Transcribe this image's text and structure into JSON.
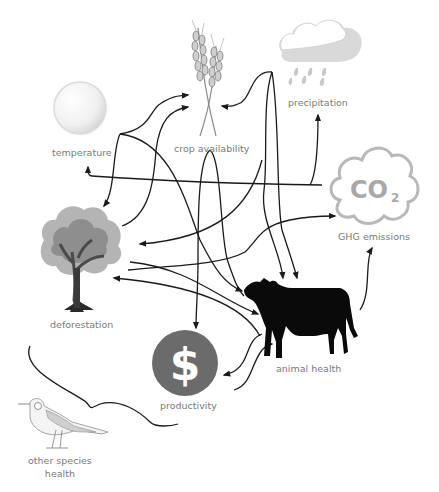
{
  "diagram": {
    "background": "#ffffff",
    "line_color": "#1a1a1a",
    "label_color": "#7a7a7a",
    "nodes": [
      {
        "id": "temperature",
        "label": "temperature",
        "icon": "sun-icon"
      },
      {
        "id": "crop",
        "label": "crop availability",
        "icon": "wheat-icon"
      },
      {
        "id": "precipitation",
        "label": "precipitation",
        "icon": "rain-cloud-icon"
      },
      {
        "id": "ghg",
        "label": "GHG emissions",
        "icon": "co2-cloud-icon",
        "icon_text": "CO",
        "icon_subscript": "2"
      },
      {
        "id": "deforestation",
        "label": "deforestation",
        "icon": "tree-icon"
      },
      {
        "id": "animal",
        "label": "animal health",
        "icon": "cow-icon"
      },
      {
        "id": "productivity",
        "label": "productivity",
        "icon": "dollar-coin-icon",
        "icon_text": "$",
        "icon_color": "#6b6b6b"
      },
      {
        "id": "other_species",
        "label_line1": "other species",
        "label_line2": "health",
        "icon": "bird-icon"
      }
    ],
    "edges": [
      {
        "from": "temperature",
        "to": "crop"
      },
      {
        "from": "temperature",
        "to": "deforestation"
      },
      {
        "from": "temperature",
        "to": "animal"
      },
      {
        "from": "deforestation",
        "to": "crop"
      },
      {
        "from": "precipitation",
        "to": "crop"
      },
      {
        "from": "precipitation",
        "to": "animal"
      },
      {
        "from": "crop",
        "to": "animal"
      },
      {
        "from": "crop",
        "to": "productivity"
      },
      {
        "from": "ghg",
        "to": "temperature"
      },
      {
        "from": "ghg",
        "to": "precipitation"
      },
      {
        "from": "deforestation",
        "to": "ghg"
      },
      {
        "from": "crop",
        "to": "deforestation"
      },
      {
        "from": "animal",
        "to": "deforestation"
      },
      {
        "from": "deforestation",
        "to": "animal"
      },
      {
        "from": "animal",
        "to": "ghg"
      },
      {
        "from": "animal",
        "to": "productivity"
      },
      {
        "from": "productivity",
        "to": "animal"
      },
      {
        "from": "deforestation",
        "to": "other_species",
        "type": "brace"
      }
    ]
  }
}
